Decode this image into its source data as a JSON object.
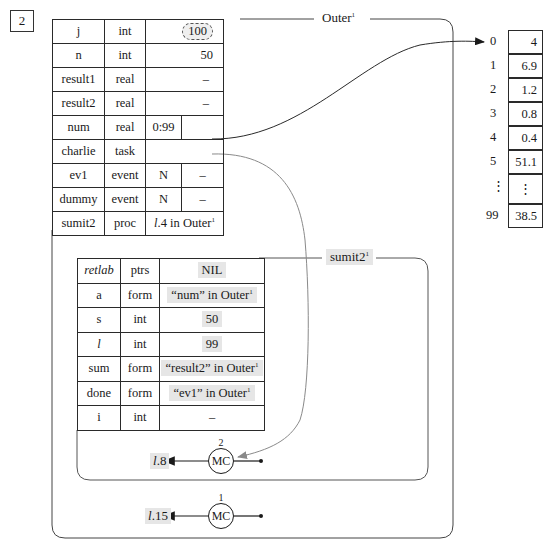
{
  "frame_number": "2",
  "outer": {
    "title": "Outer",
    "title_sup": "1",
    "rows": [
      {
        "name": "j",
        "type": "int",
        "value": "100",
        "value_style": "cloud"
      },
      {
        "name": "n",
        "type": "int",
        "value": "50"
      },
      {
        "name": "result1",
        "type": "real",
        "value": "–"
      },
      {
        "name": "result2",
        "type": "real",
        "value": "–"
      },
      {
        "name": "num",
        "type": "real",
        "range": "0:99",
        "value": ""
      },
      {
        "name": "charlie",
        "type": "task",
        "value": ""
      },
      {
        "name": "ev1",
        "type": "event",
        "flag": "N",
        "value": "–"
      },
      {
        "name": "dummy",
        "type": "event",
        "flag": "N",
        "value": "–"
      },
      {
        "name": "sumit2",
        "type": "proc",
        "value_italic": "l",
        "value": ".4 in Outer",
        "value_sup": "1"
      }
    ],
    "mc": {
      "count": "2",
      "label": "MC"
    }
  },
  "array": {
    "indices": [
      "0",
      "1",
      "2",
      "3",
      "4",
      "5",
      "⋮",
      "99"
    ],
    "values": [
      "4",
      "6.9",
      "1.2",
      "0.8",
      "0.4",
      "51.1",
      "⋮",
      "38.5"
    ]
  },
  "inner": {
    "title": "sumit2",
    "title_sup": "1",
    "rows": [
      {
        "name": "retlab",
        "name_italic": true,
        "type": "ptrs",
        "value": "NIL"
      },
      {
        "name": "a",
        "type": "form",
        "value": "“num” in Outer",
        "value_sup": "1"
      },
      {
        "name": "s",
        "type": "int",
        "value": "50"
      },
      {
        "name": "l",
        "name_italic": true,
        "type": "int",
        "value": "99"
      },
      {
        "name": "sum",
        "type": "form",
        "value": "“result2” in Outer",
        "value_sup": "1"
      },
      {
        "name": "done",
        "type": "form",
        "value": "“ev1” in Outer",
        "value_sup": "1"
      },
      {
        "name": "i",
        "type": "int",
        "value": "–"
      }
    ],
    "mc": {
      "count": "2",
      "label": "MC",
      "return_label_italic": "l",
      "return_label": ".8"
    }
  },
  "outer_mc": {
    "count": "1",
    "label": "MC",
    "return_label_italic": "l",
    "return_label": ".15"
  },
  "colors": {
    "line": "#2a2a2a",
    "shade": "#e6e6e6",
    "arrow_gray": "#8a8a8a"
  }
}
